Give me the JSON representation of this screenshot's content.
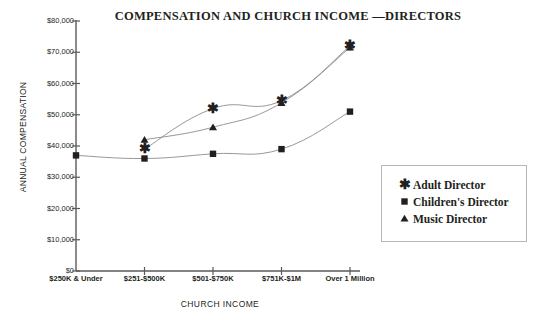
{
  "chart_data": {
    "type": "line",
    "title": "COMPENSATION AND CHURCH INCOME —DIRECTORS",
    "xlabel": "CHURCH INCOME",
    "ylabel": "ANNUAL COMPENSATION",
    "categories": [
      "$250K & Under",
      "$251-$500K",
      "$501-$750K",
      "$751K-$1M",
      "Over 1 Million"
    ],
    "ylim": [
      0,
      80000
    ],
    "ytick_values": [
      0,
      10000,
      20000,
      30000,
      40000,
      50000,
      60000,
      70000,
      80000
    ],
    "ytick_labels": [
      "$0",
      "$10,000",
      "$20,000",
      "$30,000",
      "$40,000",
      "$50,000",
      "$60,000",
      "$70,000",
      "$80,000"
    ],
    "grid": false,
    "legend_position": "right",
    "series": [
      {
        "name": "Adult Director",
        "marker": "star",
        "values": [
          null,
          39000,
          52000,
          54500,
          72000
        ]
      },
      {
        "name": "Children's Director",
        "marker": "square",
        "values": [
          37000,
          36000,
          37500,
          39000,
          51000
        ]
      },
      {
        "name": "Music Director",
        "marker": "triangle",
        "values": [
          null,
          42000,
          46000,
          53800,
          71500
        ]
      }
    ]
  },
  "legend": {
    "items": [
      {
        "label": "Adult Director",
        "marker": "star-marker-icon"
      },
      {
        "label": "Children's Director",
        "marker": "square-marker-icon"
      },
      {
        "label": "Music Director",
        "marker": "triangle-marker-icon"
      }
    ]
  },
  "colors": {
    "ink": "#231f20",
    "axis": "#5a5a5a",
    "line": "#8c8c8c",
    "legend_border": "#b9b5b2",
    "background": "#ffffff"
  }
}
